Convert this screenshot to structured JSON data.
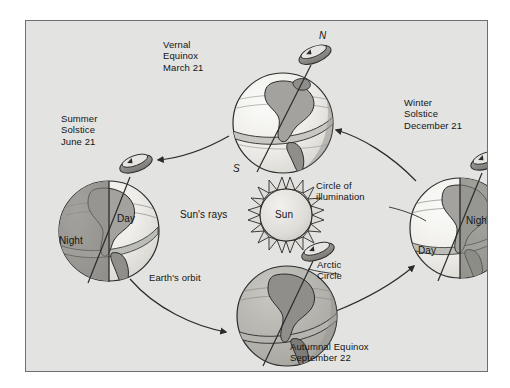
{
  "figure": {
    "background_color": "#ffffff",
    "panel_color": "#e3e3e1",
    "border_color": "#6e6e6e",
    "ink_color": "#141414"
  },
  "labels": {
    "vernal_equinox": "Vernal\nEquinox\nMarch 21",
    "vernal_equinox_line1": "Vernal",
    "vernal_equinox_line2": "Equinox",
    "vernal_equinox_line3": "March 21",
    "summer_solstice_line1": "Summer",
    "summer_solstice_line2": "Solstice",
    "summer_solstice_line3": "June 21",
    "winter_solstice_line1": "Winter",
    "winter_solstice_line2": "Solstice",
    "winter_solstice_line3": "December 21",
    "autumnal_equinox_line1": "Autumnal Equinox",
    "autumnal_equinox_line2": "September 22",
    "circle_of_illumination_line1": "Circle of",
    "circle_of_illumination_line2": "illumination",
    "arctic_circle_line1": "Arctic",
    "arctic_circle_line2": "Circle",
    "suns_rays": "Sun's rays",
    "sun": "Sun",
    "earths_orbit": "Earth's orbit",
    "north_pole": "N",
    "south_pole": "S",
    "day_left": "Day",
    "night_left": "Night",
    "day_right": "Day",
    "night_right": "Night"
  },
  "positions": {
    "globes": [
      {
        "name": "vernal-equinox-globe",
        "cx": 257,
        "cy": 102,
        "r": 50,
        "lit": "full"
      },
      {
        "name": "summer-solstice-globe",
        "cx": 83,
        "cy": 210,
        "r": 50,
        "lit": "right"
      },
      {
        "name": "autumnal-equinox-globe",
        "cx": 261,
        "cy": 295,
        "r": 50,
        "lit": "none"
      },
      {
        "name": "winter-solstice-globe",
        "cx": 434,
        "cy": 207,
        "r": 50,
        "lit": "left"
      }
    ],
    "sun": {
      "cx": 260,
      "cy": 194,
      "r": 26
    }
  },
  "colors": {
    "globe_light": "#f0efec",
    "globe_shade": "#b8b7b3",
    "globe_dark": "#8f8e8a",
    "globe_land": "#a3a29e",
    "globe_land_dark": "#7d7c78",
    "sun_fill": "#dddcd8",
    "outline": "#2b2b2b",
    "axis_ring": "#8d8c88"
  }
}
